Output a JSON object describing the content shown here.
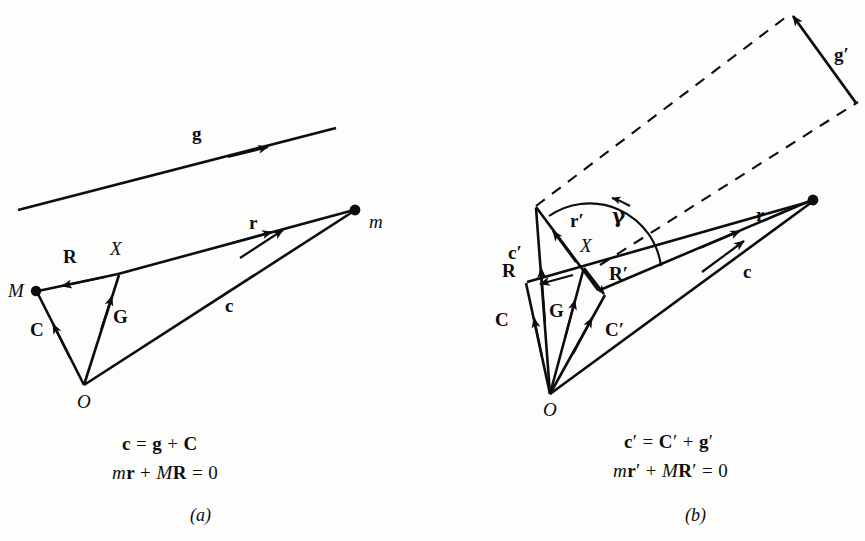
{
  "figure": {
    "background_color": "#fdfdfb",
    "ink_color": "#0d0d0d"
  },
  "panel_a": {
    "caption": "(a)",
    "equations": [
      {
        "parts": [
          {
            "t": "c",
            "s": "vec"
          },
          {
            "t": " = ",
            "s": "op"
          },
          {
            "t": "g",
            "s": "vec"
          },
          {
            "t": " + ",
            "s": "op"
          },
          {
            "t": "C",
            "s": "vec"
          }
        ],
        "text": "c = g + C"
      },
      {
        "parts": [
          {
            "t": "m",
            "s": "it"
          },
          {
            "t": "r",
            "s": "vec"
          },
          {
            "t": " + ",
            "s": "op"
          },
          {
            "t": "M",
            "s": "it"
          },
          {
            "t": "R",
            "s": "vec"
          },
          {
            "t": " = 0",
            "s": "op"
          }
        ],
        "text": "mr + MR = 0"
      }
    ],
    "vectors": [
      {
        "name": "g",
        "label": "g",
        "style": "solid",
        "arrow": "mid"
      },
      {
        "name": "r",
        "label": "r",
        "style": "solid",
        "arrow": "mid"
      },
      {
        "name": "R",
        "label": "R",
        "style": "solid",
        "arrow": "mid"
      },
      {
        "name": "C",
        "label": "C",
        "style": "solid",
        "arrow": "mid"
      },
      {
        "name": "G",
        "label": "G",
        "style": "solid",
        "arrow": "mid"
      },
      {
        "name": "c",
        "label": "c",
        "style": "solid",
        "arrow": "mid"
      }
    ],
    "points": [
      {
        "name": "M",
        "label": "M",
        "dot": true
      },
      {
        "name": "X",
        "label": "X",
        "dot": false
      },
      {
        "name": "O",
        "label": "O",
        "dot": false
      },
      {
        "name": "m",
        "label": "m",
        "dot": true
      }
    ]
  },
  "panel_b": {
    "caption": "(b)",
    "equations": [
      {
        "text": "c′ = C′ + g′"
      },
      {
        "text": "mr′ + MR′ = 0"
      }
    ],
    "vectors": [
      {
        "name": "g-prime",
        "label": "g′",
        "style": "solid",
        "arrow": "end"
      },
      {
        "name": "r",
        "label": "r",
        "style": "solid",
        "arrow": "mid"
      },
      {
        "name": "r-prime",
        "label": "r′",
        "style": "solid",
        "arrow": "mid"
      },
      {
        "name": "R",
        "label": "R",
        "style": "solid",
        "arrow": "mid"
      },
      {
        "name": "R-prime",
        "label": "R′",
        "style": "solid",
        "arrow": "mid"
      },
      {
        "name": "C",
        "label": "C",
        "style": "solid",
        "arrow": "mid"
      },
      {
        "name": "C-prime",
        "label": "C′",
        "style": "solid",
        "arrow": "mid"
      },
      {
        "name": "c",
        "label": "c",
        "style": "solid",
        "arrow": "mid"
      },
      {
        "name": "c-prime",
        "label": "c′",
        "style": "solid",
        "arrow": "mid"
      },
      {
        "name": "G",
        "label": "G",
        "style": "solid",
        "arrow": "mid"
      }
    ],
    "angle": {
      "name": "gamma",
      "label": "γ",
      "arc": true,
      "arrow": "end"
    },
    "points": [
      {
        "name": "X",
        "label": "X",
        "dot": false
      },
      {
        "name": "O",
        "label": "O",
        "dot": false
      },
      {
        "name": "m",
        "label": "",
        "dot": true
      }
    ],
    "dashed_guides": 2
  },
  "labels": {
    "a_g": "g",
    "a_r": "r",
    "a_R": "R",
    "a_C": "C",
    "a_G": "G",
    "a_c": "c",
    "a_M": "M",
    "a_X": "X",
    "a_O": "O",
    "a_m": "m",
    "b_gp": "g′",
    "b_r": "r",
    "b_rp": "r′",
    "b_gamma": "γ",
    "b_cp": "c′",
    "b_R": "R",
    "b_Rp": "R′",
    "b_C": "C",
    "b_Cp": "C′",
    "b_G": "G",
    "b_c": "c",
    "b_X": "X",
    "b_O": "O",
    "eq_a1": "c = g + C",
    "eq_a2": "mr + MR = 0",
    "eq_b1": "c′ = C′ + g′",
    "eq_b2": "mr′ + MR′ = 0",
    "cap_a": "(a)",
    "cap_b": "(b)"
  }
}
